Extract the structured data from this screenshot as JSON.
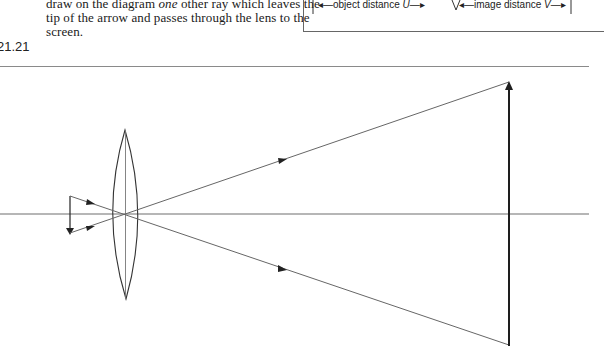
{
  "question_text": {
    "line1_pre": "draw on the diagram ",
    "line1_em": "one",
    "line1_post": " other ray which leaves the",
    "line2": "tip of the arrow and passes through the lens to the",
    "line3": "screen."
  },
  "figure_number": "21.21",
  "inset": {
    "object_distance_label": "object distance",
    "object_distance_symbol": "U",
    "image_distance_label": "image distance",
    "image_distance_symbol": "V"
  },
  "diagram": {
    "colors": {
      "axis": "#6e6e6e",
      "ray": "#555555",
      "lens": "#333333",
      "object": "#222222",
      "screen": "#1e1e1e"
    },
    "elements": [
      {
        "name": "optical-axis",
        "type": "line"
      },
      {
        "name": "object-arrow",
        "type": "arrow",
        "direction": "down"
      },
      {
        "name": "convex-lens",
        "type": "lens"
      },
      {
        "name": "ray-from-top",
        "type": "ray"
      },
      {
        "name": "ray-from-bottom",
        "type": "ray"
      },
      {
        "name": "screen-image-arrow",
        "type": "arrow",
        "direction": "up"
      }
    ]
  }
}
